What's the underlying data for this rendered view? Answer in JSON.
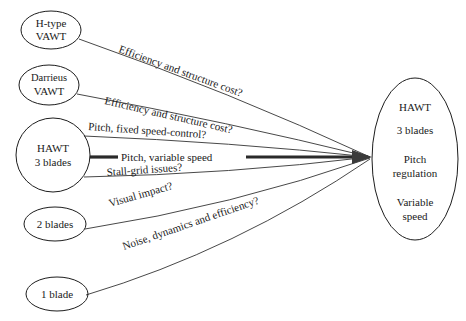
{
  "diagram": {
    "background_color": "#ffffff",
    "stroke_color": "#1d1d1d",
    "text_color": "#1a1a1a",
    "source_nodes": [
      {
        "id": "h-type-vawt",
        "shape": "ellipse",
        "lines": [
          "H-type",
          "VAWT"
        ],
        "cx": 51,
        "cy": 30,
        "rx": 30,
        "ry": 19
      },
      {
        "id": "darrieus-vawt",
        "shape": "ellipse",
        "lines": [
          "Darrieus",
          "VAWT"
        ],
        "cx": 49,
        "cy": 85,
        "rx": 30,
        "ry": 20
      },
      {
        "id": "hawt-3-blades",
        "shape": "circle",
        "lines": [
          "HAWT",
          "3 blades"
        ],
        "cx": 53,
        "cy": 155,
        "rx": 37,
        "ry": 37
      },
      {
        "id": "2-blades",
        "shape": "ellipse",
        "lines": [
          "2 blades"
        ],
        "cx": 55,
        "cy": 224,
        "rx": 31,
        "ry": 17
      },
      {
        "id": "1-blade",
        "shape": "ellipse",
        "lines": [
          "1 blade"
        ],
        "cx": 57,
        "cy": 294,
        "rx": 31,
        "ry": 17
      }
    ],
    "target_node": {
      "id": "hawt-target",
      "shape": "ellipse",
      "lines": [
        "HAWT",
        "3 blades",
        "Pitch",
        "regulation",
        "Variable",
        "speed"
      ],
      "cx": 415,
      "cy": 159,
      "rx": 43,
      "ry": 81
    },
    "edges": [
      {
        "id": "edge-h-type",
        "from": "h-type-vawt",
        "to": "hawt-target",
        "label": "Efficiency and structure cost?",
        "label_x": 118,
        "label_y": 52,
        "label_rotation": 20,
        "emphasis": "normal"
      },
      {
        "id": "edge-darrieus",
        "from": "darrieus-vawt",
        "to": "hawt-target",
        "label": "Efficiency and structure cost?",
        "label_x": 104,
        "label_y": 104,
        "label_rotation": 13,
        "emphasis": "normal"
      },
      {
        "id": "edge-pitch-fixed",
        "from": "hawt-3-blades",
        "to": "hawt-target",
        "label": "Pitch, fixed speed-control?",
        "label_x": 88,
        "label_y": 130,
        "label_rotation": 4,
        "emphasis": "normal"
      },
      {
        "id": "edge-pitch-variable",
        "from": "hawt-3-blades",
        "to": "hawt-target",
        "label": "Pitch, variable speed",
        "label_x": 121,
        "label_y": 160,
        "label_rotation": 0,
        "emphasis": "bold"
      },
      {
        "id": "edge-stall-grid",
        "from": "hawt-3-blades",
        "to": "hawt-target",
        "label": "Stall-grid issues?",
        "label_x": 107,
        "label_y": 176,
        "label_rotation": -4,
        "emphasis": "normal"
      },
      {
        "id": "edge-visual-impact",
        "from": "2-blades",
        "to": "hawt-target",
        "label": "Visual impact?",
        "label_x": 110,
        "label_y": 207,
        "label_rotation": -16,
        "emphasis": "normal"
      },
      {
        "id": "edge-noise-dynamics",
        "from": "1-blade",
        "to": "hawt-target",
        "label": "Noise, dynamics and efficiency?",
        "label_x": 124,
        "label_y": 250,
        "label_rotation": -19,
        "emphasis": "normal"
      }
    ]
  }
}
